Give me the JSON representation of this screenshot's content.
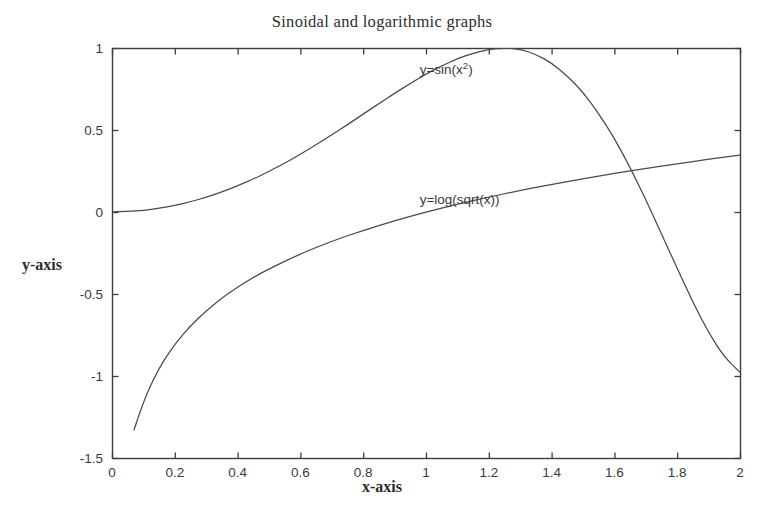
{
  "chart_data": {
    "type": "line",
    "title": "Sinoidal and logarithmic graphs",
    "xlabel": "x-axis",
    "ylabel": "y-axis",
    "xlim": [
      0,
      2
    ],
    "ylim": [
      -1.5,
      1
    ],
    "grid": false,
    "legend": "inline-annotations",
    "xticks": [
      0,
      0.2,
      0.4,
      0.6,
      0.8,
      1,
      1.2,
      1.4,
      1.6,
      1.8,
      2
    ],
    "xticklabels": [
      "0",
      "0.2",
      "0.4",
      "0.6",
      "0.8",
      "1",
      "1.2",
      "1.4",
      "1.6",
      "1.8",
      "2"
    ],
    "yticks": [
      1,
      0.5,
      0,
      -0.5,
      -1,
      -1.5
    ],
    "yticklabels": [
      "1",
      "0.5",
      "0",
      "-0.5",
      "-1",
      "-1.5"
    ],
    "line_color": "#4a4a4a",
    "axis_color": "#3c3c3c",
    "background": "#ffffff",
    "annotations": [
      {
        "name": "sine-curve-label",
        "text_html": "y=sin(x<sup>2</sup>)",
        "text": "y=sin(x^2)",
        "x": 0.98,
        "y": 0.86
      },
      {
        "name": "log-curve-label",
        "text_html": "y=log(sqrt(x))",
        "text": "y=log(sqrt(x))",
        "x": 0.98,
        "y": 0.07
      }
    ],
    "series": [
      {
        "name": "y=sin(x^2)",
        "expression": "sin(x^2)",
        "x": [
          0,
          0.05,
          0.1,
          0.15,
          0.2,
          0.25,
          0.3,
          0.35,
          0.4,
          0.45,
          0.5,
          0.55,
          0.6,
          0.65,
          0.7,
          0.75,
          0.8,
          0.85,
          0.9,
          0.95,
          1,
          1.05,
          1.1,
          1.15,
          1.2,
          1.25,
          1.2533,
          1.3,
          1.35,
          1.4,
          1.45,
          1.5,
          1.55,
          1.6,
          1.65,
          1.7,
          1.75,
          1.8,
          1.85,
          1.9,
          1.95,
          2
        ],
        "values": [
          0,
          0.0025,
          0.01,
          0.0225,
          0.04,
          0.0625,
          0.0899,
          0.1222,
          0.1593,
          0.2013,
          0.2474,
          0.2978,
          0.3523,
          0.4096,
          0.4706,
          0.5323,
          0.5972,
          0.6603,
          0.7243,
          0.7833,
          0.8415,
          0.8912,
          0.9356,
          0.9681,
          0.9917,
          0.9999,
          1.0,
          0.9928,
          0.9614,
          0.9086,
          0.8299,
          0.7308,
          0.6002,
          0.4492,
          0.2717,
          0.0759,
          -0.1337,
          -0.3436,
          -0.5509,
          -0.7357,
          -0.8841,
          -0.9773
        ]
      },
      {
        "name": "y=log(sqrt(x))",
        "expression": "log(sqrt(x))",
        "x": [
          0.07,
          0.1,
          0.15,
          0.2,
          0.25,
          0.3,
          0.35,
          0.4,
          0.45,
          0.5,
          0.6,
          0.7,
          0.8,
          0.9,
          1,
          1.1,
          1.2,
          1.3,
          1.4,
          1.5,
          1.6,
          1.7,
          1.8,
          1.9,
          2
        ],
        "values": [
          -1.329,
          -1.151,
          -0.949,
          -0.805,
          -0.693,
          -0.602,
          -0.525,
          -0.458,
          -0.399,
          -0.347,
          -0.255,
          -0.178,
          -0.112,
          -0.053,
          0,
          0.0477,
          0.0912,
          0.1312,
          0.1682,
          0.2027,
          0.235,
          0.2653,
          0.294,
          0.3212,
          0.3466
        ]
      }
    ]
  },
  "axes_geometry": {
    "left": 112,
    "right": 740,
    "top": 48,
    "bottom": 458
  }
}
